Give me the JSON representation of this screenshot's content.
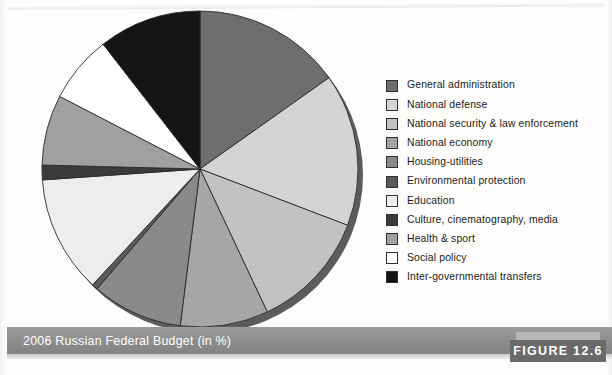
{
  "figure": {
    "caption": "2006 Russian Federal Budget (in %)",
    "badge": "FIGURE 12.6"
  },
  "legend": {
    "items": [
      {
        "label": "General administration",
        "color": "#6e6e6e"
      },
      {
        "label": "National defense",
        "color": "#d4d4d4"
      },
      {
        "label": "National security & law enforcement",
        "color": "#c2c2c2"
      },
      {
        "label": "National economy",
        "color": "#a6a6a6"
      },
      {
        "label": "Housing-utilities",
        "color": "#8a8a8a"
      },
      {
        "label": "Environmental protection",
        "color": "#5a5a5a"
      },
      {
        "label": "Education",
        "color": "#ededed"
      },
      {
        "label": "Culture, cinematography, media",
        "color": "#3a3a3a"
      },
      {
        "label": "Health & sport",
        "color": "#a0a0a0"
      },
      {
        "label": "Social policy",
        "color": "#ffffff"
      },
      {
        "label": "Inter-governmental transfers",
        "color": "#141414"
      }
    ]
  },
  "chart_data": {
    "type": "pie",
    "title": "2006 Russian Federal Budget (in %)",
    "unit": "%",
    "start_angle_deg": 0,
    "direction": "clockwise",
    "legend_position": "right",
    "grid": false,
    "categories": [
      "General administration",
      "National defense",
      "National security & law enforcement",
      "National economy",
      "Housing-utilities",
      "Environmental protection",
      "Education",
      "Culture, cinematography, media",
      "Health & sport",
      "Social policy",
      "Inter-governmental transfers"
    ],
    "values": [
      15.2,
      15.6,
      12.2,
      9.0,
      9.3,
      0.6,
      12.0,
      1.5,
      7.2,
      6.9,
      10.5
    ],
    "colors": [
      "#6e6e6e",
      "#d4d4d4",
      "#c2c2c2",
      "#a6a6a6",
      "#8a8a8a",
      "#5a5a5a",
      "#ededed",
      "#3a3a3a",
      "#a0a0a0",
      "#ffffff",
      "#141414"
    ]
  },
  "pie_geometry": {
    "cx": 162,
    "cy": 162,
    "r": 158,
    "stroke": "#2b2b2b",
    "stroke_width": 0.9,
    "shadow_color": "#5c5c5c"
  }
}
